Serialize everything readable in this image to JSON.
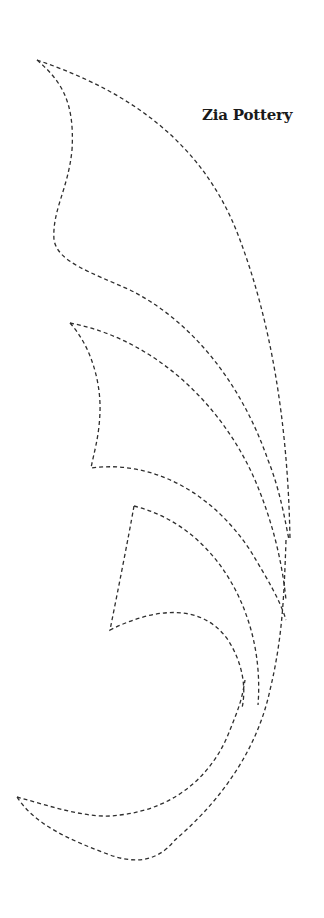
{
  "document": {
    "title": "Zia Pottery",
    "kind": "pattern-template"
  },
  "pattern": {
    "description": "Dashed cut-line outline of a feather/leaf shape made of four stacked curved segments",
    "stroke_color": "#2e2e2e",
    "line_style": "dashed",
    "segments": [
      {
        "name": "top-segment"
      },
      {
        "name": "upper-middle-segment"
      },
      {
        "name": "lower-middle-segment"
      },
      {
        "name": "bottom-segment"
      }
    ]
  },
  "colors": {
    "background": "#ffffff",
    "text": "#1a1a1a",
    "line": "#2e2e2e"
  }
}
